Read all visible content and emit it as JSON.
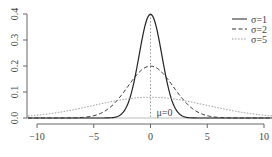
{
  "chart_data": {
    "type": "line",
    "title": "",
    "xlabel": "",
    "ylabel": "",
    "xlim": [
      -11,
      11
    ],
    "ylim": [
      0,
      0.4
    ],
    "x_ticks": [
      "−10",
      "−5",
      "0",
      "5",
      "10"
    ],
    "y_ticks": [
      "0.0",
      "0.1",
      "0.2",
      "0.3",
      "0.4"
    ],
    "series": [
      {
        "name": "σ=1",
        "style": "solid",
        "color": "#222222",
        "mu": 0,
        "sigma": 1,
        "peak": 0.399
      },
      {
        "name": "σ=2",
        "style": "dashed",
        "color": "#333333",
        "mu": 0,
        "sigma": 2,
        "peak": 0.199
      },
      {
        "name": "σ=5",
        "style": "dotted",
        "color": "#999999",
        "mu": 0,
        "sigma": 5,
        "peak": 0.08
      }
    ],
    "annotations": [
      {
        "text": "μ=0",
        "x": 0,
        "y": 0
      }
    ],
    "vline": {
      "x": 0,
      "style": "dotted"
    },
    "legend_position": "top-right",
    "grid": false
  }
}
